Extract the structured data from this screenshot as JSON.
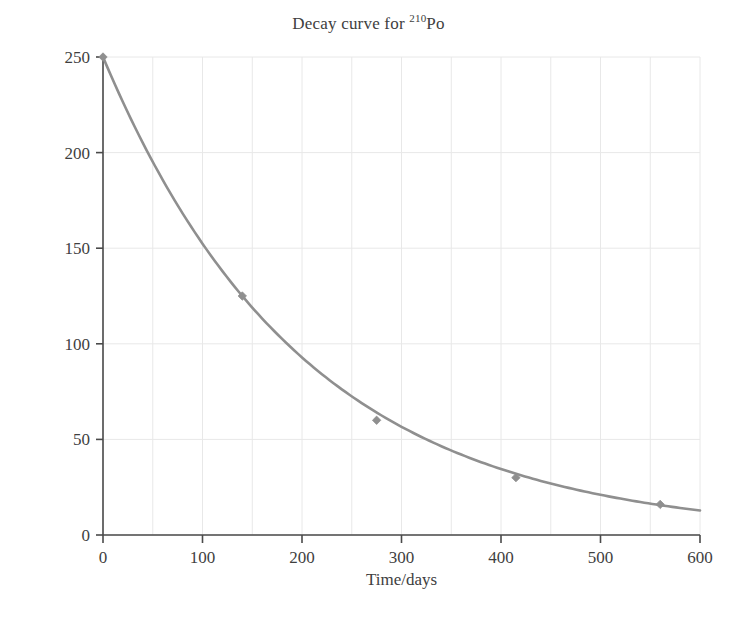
{
  "chart_data": {
    "type": "line",
    "title": "Decay curve for 210Po",
    "title_main": "Decay curve for ",
    "title_superscript": "210",
    "title_element": "Po",
    "xlabel": "Time/days",
    "ylabel": "Mass of polonium-210/g",
    "xlim": [
      0,
      600
    ],
    "ylim": [
      0,
      250
    ],
    "xticks": [
      0,
      100,
      200,
      300,
      400,
      500,
      600
    ],
    "yticks": [
      0,
      50,
      100,
      150,
      200,
      250
    ],
    "xtick_labels": [
      "0",
      "100",
      "200",
      "300",
      "400",
      "500",
      "600"
    ],
    "ytick_labels": [
      "0",
      "50",
      "100",
      "150",
      "200",
      "250"
    ],
    "grid": true,
    "grid_x_step": 50,
    "grid_y_step": 50,
    "grid_color": "#e8e8e8",
    "legend": null,
    "line_color": "#8f8f8f",
    "marker_color": "#8f8f8f",
    "marker_shape": "diamond",
    "initial_mass": 250,
    "half_life_days": 140,
    "markers": [
      {
        "x": 0,
        "y": 250
      },
      {
        "x": 140,
        "y": 125
      },
      {
        "x": 275,
        "y": 60
      },
      {
        "x": 415,
        "y": 30
      },
      {
        "x": 560,
        "y": 16
      }
    ],
    "x": [
      0,
      20,
      40,
      60,
      80,
      100,
      120,
      140,
      160,
      180,
      200,
      220,
      240,
      260,
      275,
      300,
      320,
      340,
      360,
      380,
      400,
      415,
      440,
      460,
      480,
      500,
      520,
      540,
      560,
      580,
      600
    ],
    "y": [
      250,
      227.7,
      207.4,
      188.9,
      172.1,
      156.8,
      142.8,
      125,
      118.4,
      107.9,
      98.3,
      89.5,
      81.5,
      74.3,
      60,
      62.7,
      57.1,
      52.0,
      47.4,
      43.2,
      39.3,
      30,
      32.6,
      29.7,
      27.1,
      24.7,
      22.5,
      20.5,
      16,
      17.0,
      15.5
    ]
  }
}
